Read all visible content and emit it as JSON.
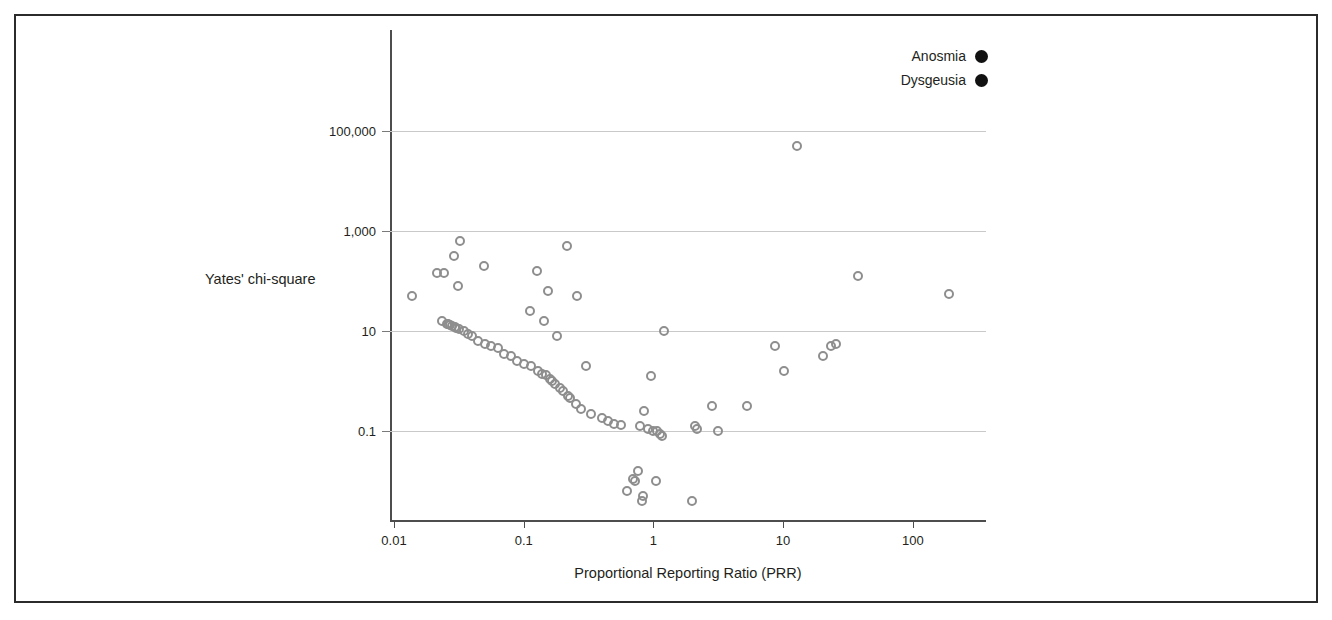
{
  "figure": {
    "border_color": "#2b2b2b",
    "background": "#ffffff"
  },
  "legend": {
    "position": "top-right",
    "entries": [
      {
        "label": "Anosmia",
        "color": "#111111",
        "marker": "filled-circle"
      },
      {
        "label": "Dysgeusia",
        "color": "#111111",
        "marker": "filled-circle"
      }
    ]
  },
  "chart_data": {
    "type": "scatter",
    "title": "",
    "subtitle": "",
    "xlabel": "Proportional Reporting Ratio (PRR)",
    "ylabel": "Yates' chi-square",
    "xscale": "log",
    "yscale": "log",
    "xlim": [
      0.01,
      400
    ],
    "ylim": [
      0.0028,
      1000000
    ],
    "xticks": [
      0.01,
      0.1,
      1,
      10,
      100
    ],
    "xticklabels": [
      "0.01",
      "0.1",
      "1",
      "10",
      "100"
    ],
    "yticks": [
      0.1,
      10,
      1000,
      100000
    ],
    "yticklabels": [
      "0.1",
      "10",
      "1,000",
      "100,000"
    ],
    "grid": "horizontal",
    "grid_color": "#c9c9c9",
    "marker": {
      "style": "open-circle",
      "edge_color": "#8e8e8e",
      "fill": "none",
      "size_px": 10
    },
    "series": [
      {
        "name": "Anosmia / Dysgeusia drug signals",
        "points": [
          {
            "x": 0.0138,
            "y": 50.1
          },
          {
            "x": 0.0216,
            "y": 141.3
          },
          {
            "x": 0.0236,
            "y": 15.8
          },
          {
            "x": 0.0245,
            "y": 141.3
          },
          {
            "x": 0.0256,
            "y": 14.1
          },
          {
            "x": 0.0263,
            "y": 14.1
          },
          {
            "x": 0.0272,
            "y": 13.2
          },
          {
            "x": 0.0282,
            "y": 12.6
          },
          {
            "x": 0.0288,
            "y": 316.2
          },
          {
            "x": 0.0295,
            "y": 12.0
          },
          {
            "x": 0.0302,
            "y": 11.5
          },
          {
            "x": 0.0309,
            "y": 79.4
          },
          {
            "x": 0.0316,
            "y": 11.0
          },
          {
            "x": 0.0324,
            "y": 631.0
          },
          {
            "x": 0.0347,
            "y": 10.0
          },
          {
            "x": 0.0372,
            "y": 8.9
          },
          {
            "x": 0.0398,
            "y": 7.9
          },
          {
            "x": 0.0447,
            "y": 6.3
          },
          {
            "x": 0.049,
            "y": 199.5
          },
          {
            "x": 0.0501,
            "y": 5.6
          },
          {
            "x": 0.0562,
            "y": 5.0
          },
          {
            "x": 0.0631,
            "y": 4.5
          },
          {
            "x": 0.0708,
            "y": 3.5
          },
          {
            "x": 0.0794,
            "y": 3.2
          },
          {
            "x": 0.0891,
            "y": 2.5
          },
          {
            "x": 0.1,
            "y": 2.2
          },
          {
            "x": 0.1122,
            "y": 25.1
          },
          {
            "x": 0.1148,
            "y": 2.0
          },
          {
            "x": 0.1259,
            "y": 158.5
          },
          {
            "x": 0.1288,
            "y": 1.6
          },
          {
            "x": 0.138,
            "y": 1.4
          },
          {
            "x": 0.1445,
            "y": 15.8
          },
          {
            "x": 0.1479,
            "y": 1.3
          },
          {
            "x": 0.1549,
            "y": 63.1
          },
          {
            "x": 0.1585,
            "y": 1.1
          },
          {
            "x": 0.166,
            "y": 1.0
          },
          {
            "x": 0.1738,
            "y": 0.89
          },
          {
            "x": 0.182,
            "y": 7.9
          },
          {
            "x": 0.1905,
            "y": 0.71
          },
          {
            "x": 0.2,
            "y": 0.63
          },
          {
            "x": 0.2138,
            "y": 501.2
          },
          {
            "x": 0.2188,
            "y": 0.5
          },
          {
            "x": 0.2291,
            "y": 0.45
          },
          {
            "x": 0.2512,
            "y": 0.35
          },
          {
            "x": 0.257,
            "y": 50.1
          },
          {
            "x": 0.2754,
            "y": 0.28
          },
          {
            "x": 0.302,
            "y": 2.0
          },
          {
            "x": 0.3311,
            "y": 0.22
          },
          {
            "x": 0.3981,
            "y": 0.18
          },
          {
            "x": 0.4467,
            "y": 0.16
          },
          {
            "x": 0.5012,
            "y": 0.14
          },
          {
            "x": 0.5623,
            "y": 0.13
          },
          {
            "x": 0.631,
            "y": 0.0063
          },
          {
            "x": 0.6918,
            "y": 0.0112
          },
          {
            "x": 0.7244,
            "y": 0.01
          },
          {
            "x": 0.7586,
            "y": 0.0158
          },
          {
            "x": 0.7943,
            "y": 0.126
          },
          {
            "x": 0.8128,
            "y": 0.004
          },
          {
            "x": 0.8318,
            "y": 0.005
          },
          {
            "x": 0.8511,
            "y": 0.25
          },
          {
            "x": 0.912,
            "y": 0.112
          },
          {
            "x": 0.955,
            "y": 1.26
          },
          {
            "x": 1.0,
            "y": 0.1
          },
          {
            "x": 1.0471,
            "y": 0.01
          },
          {
            "x": 1.0715,
            "y": 0.1
          },
          {
            "x": 1.122,
            "y": 0.089
          },
          {
            "x": 1.1749,
            "y": 0.079
          },
          {
            "x": 1.2023,
            "y": 10.0
          },
          {
            "x": 1.9953,
            "y": 0.004
          },
          {
            "x": 2.0893,
            "y": 0.126
          },
          {
            "x": 2.1878,
            "y": 0.112
          },
          {
            "x": 2.8184,
            "y": 0.316
          },
          {
            "x": 3.1623,
            "y": 0.1
          },
          {
            "x": 5.2481,
            "y": 0.316
          },
          {
            "x": 8.7096,
            "y": 5.01
          },
          {
            "x": 10.2329,
            "y": 1.58
          },
          {
            "x": 12.8825,
            "y": 50119.0
          },
          {
            "x": 20.4174,
            "y": 3.16
          },
          {
            "x": 23.4423,
            "y": 5.01
          },
          {
            "x": 25.704,
            "y": 5.62
          },
          {
            "x": 38.0189,
            "y": 125.9
          },
          {
            "x": 190.5461,
            "y": 56.2
          }
        ]
      }
    ]
  }
}
